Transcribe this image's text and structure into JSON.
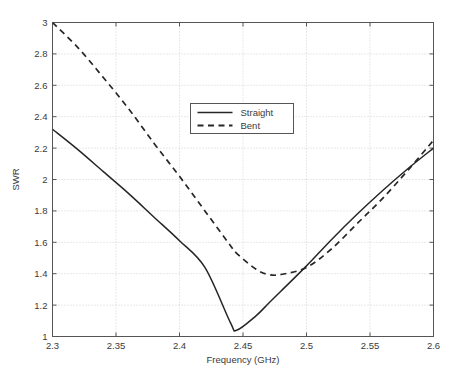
{
  "chart_data": {
    "type": "line",
    "title": "",
    "xlabel": "Frequency (GHz)",
    "ylabel": "SWR",
    "xlim": [
      2.3,
      2.6
    ],
    "ylim": [
      1,
      3
    ],
    "xticks": [
      "2.3",
      "2.35",
      "2.4",
      "2.45",
      "2.5",
      "2.55",
      "2.6"
    ],
    "xtick_values": [
      2.3,
      2.35,
      2.4,
      2.45,
      2.5,
      2.55,
      2.6
    ],
    "yticks": [
      "1",
      "1.2",
      "1.4",
      "1.6",
      "1.8",
      "2",
      "2.2",
      "2.4",
      "2.6",
      "2.8",
      "3"
    ],
    "ytick_values": [
      1,
      1.2,
      1.4,
      1.6,
      1.8,
      2,
      2.2,
      2.4,
      2.6,
      2.8,
      3
    ],
    "grid": true,
    "legend_position": "upper center",
    "x": [
      2.3,
      2.32,
      2.34,
      2.36,
      2.38,
      2.4,
      2.42,
      2.44,
      2.445,
      2.46,
      2.47,
      2.48,
      2.5,
      2.52,
      2.54,
      2.56,
      2.58,
      2.6
    ],
    "series": [
      {
        "name": "Straight",
        "style": "solid",
        "color": "#262626",
        "values": [
          2.32,
          2.19,
          2.05,
          1.91,
          1.76,
          1.61,
          1.44,
          1.09,
          1.04,
          1.13,
          1.21,
          1.29,
          1.45,
          1.62,
          1.78,
          1.93,
          2.07,
          2.2
        ]
      },
      {
        "name": "Bent",
        "style": "dashed",
        "color": "#262626",
        "values": [
          3.0,
          2.84,
          2.65,
          2.45,
          2.23,
          2.02,
          1.8,
          1.58,
          1.53,
          1.43,
          1.395,
          1.395,
          1.44,
          1.56,
          1.72,
          1.88,
          2.06,
          2.25
        ]
      }
    ],
    "annotations": {
      "straight_minimum": {
        "x": 2.445,
        "y": 1.04
      },
      "bent_minimum": {
        "x": 2.472,
        "y": 1.39
      }
    }
  },
  "legend": {
    "entries": [
      {
        "label": "Straight",
        "style": "solid"
      },
      {
        "label": "Bent",
        "style": "dashed"
      }
    ]
  },
  "colors": {
    "line": "#262626",
    "axis": "#555555",
    "grid": "#c8c8c8",
    "text": "#3a3a3a",
    "background": "#ffffff"
  }
}
